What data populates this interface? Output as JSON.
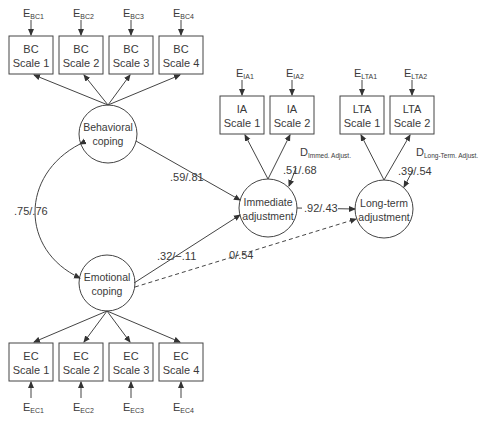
{
  "diagram": {
    "type": "structural-equation-model",
    "latents": {
      "behavioral": {
        "line1": "Behavioral",
        "line2": "coping",
        "cx": 108,
        "cy": 134
      },
      "emotional": {
        "line1": "Emotional",
        "line2": "coping",
        "cx": 107,
        "cy": 283
      },
      "immediate": {
        "line1": "Immediate",
        "line2": "adjustment",
        "cx": 268,
        "cy": 208
      },
      "longterm": {
        "line1": "Long-term",
        "line2": "adjustment",
        "cx": 384,
        "cy": 209
      }
    },
    "indicators": {
      "bc": [
        {
          "line1": "BC",
          "line2": "Scale 1",
          "error_main": "E",
          "error_sub": "BC1"
        },
        {
          "line1": "BC",
          "line2": "Scale 2",
          "error_main": "E",
          "error_sub": "BC2"
        },
        {
          "line1": "BC",
          "line2": "Scale 3",
          "error_main": "E",
          "error_sub": "BC3"
        },
        {
          "line1": "BC",
          "line2": "Scale 4",
          "error_main": "E",
          "error_sub": "BC4"
        }
      ],
      "ec": [
        {
          "line1": "EC",
          "line2": "Scale 1",
          "error_main": "E",
          "error_sub": "EC1"
        },
        {
          "line1": "EC",
          "line2": "Scale 2",
          "error_main": "E",
          "error_sub": "EC2"
        },
        {
          "line1": "EC",
          "line2": "Scale 3",
          "error_main": "E",
          "error_sub": "EC3"
        },
        {
          "line1": "EC",
          "line2": "Scale 4",
          "error_main": "E",
          "error_sub": "EC4"
        }
      ],
      "ia": [
        {
          "line1": "IA",
          "line2": "Scale 1",
          "error_main": "E",
          "error_sub": "IA1"
        },
        {
          "line1": "IA",
          "line2": "Scale 2",
          "error_main": "E",
          "error_sub": "IA2"
        }
      ],
      "lta": [
        {
          "line1": "LTA",
          "line2": "Scale 1",
          "error_main": "E",
          "error_sub": "LTA1"
        },
        {
          "line1": "LTA",
          "line2": "Scale 2",
          "error_main": "E",
          "error_sub": "LTA2"
        }
      ]
    },
    "disturbances": {
      "immediate": {
        "main": "D",
        "sub": "Immed. Adjust.",
        "value": ".51/.68"
      },
      "longterm": {
        "main": "D",
        "sub": "Long-Term. Adjust.",
        "value": ".39/.54"
      }
    },
    "paths": {
      "correlation_bc_ec": ".75/.76",
      "bc_to_ia": ".59/.81",
      "ec_to_ia": ".32/−.11",
      "ia_to_lta": ".92/.43",
      "ec_to_lta": "0/.54"
    },
    "colors": {
      "line": "#444444",
      "text": "#3a3a3a",
      "background": "#ffffff"
    }
  }
}
